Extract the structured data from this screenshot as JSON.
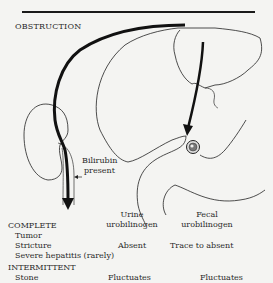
{
  "title": "OBSTRUCTION",
  "annotation": {
    "line1": "Bilirubin",
    "line2": "present"
  },
  "columns": {
    "urine": {
      "line1": "Urine",
      "line2": "urobilinogen"
    },
    "fecal": {
      "line1": "Fecal",
      "line2": "urobilinogen"
    }
  },
  "sections": [
    {
      "heading": "COMPLETE",
      "causes": [
        "Tumor",
        "Stricture",
        "Severe hepatitis (rarely)"
      ],
      "urine": "Absent",
      "fecal": "Trace to absent"
    },
    {
      "heading": "INTERMITTENT",
      "causes": [
        "Stone"
      ],
      "urine": "Fluctuates",
      "fecal": "Fluctuates"
    }
  ]
}
